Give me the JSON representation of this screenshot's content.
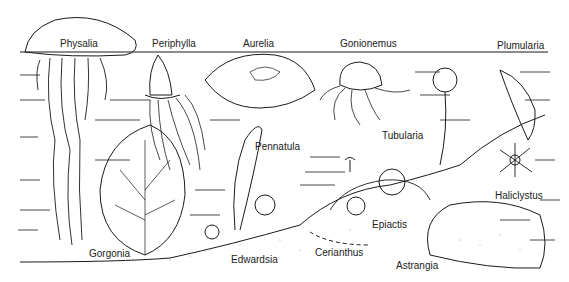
{
  "colors": {
    "ink": "#1a1a1a",
    "background": "#ffffff",
    "sand": "#bbbbbb"
  },
  "labels": [
    {
      "id": "physalia",
      "text": "Physalia",
      "x": 60,
      "y": 39
    },
    {
      "id": "periphylla",
      "text": "Periphylla",
      "x": 152,
      "y": 39
    },
    {
      "id": "aurelia",
      "text": "Aurelia",
      "x": 243,
      "y": 39
    },
    {
      "id": "gonionemus",
      "text": "Gonionemus",
      "x": 340,
      "y": 39
    },
    {
      "id": "plumularia",
      "text": "Plumularia",
      "x": 497,
      "y": 41
    },
    {
      "id": "tubularia",
      "text": "Tubularia",
      "x": 382,
      "y": 131
    },
    {
      "id": "pennatula",
      "text": "Pennatula",
      "x": 255,
      "y": 142
    },
    {
      "id": "haliclystus",
      "text": "Haliclystus",
      "x": 495,
      "y": 191
    },
    {
      "id": "epiactis",
      "text": "Epiactis",
      "x": 372,
      "y": 220
    },
    {
      "id": "gorgonia",
      "text": "Gorgonia",
      "x": 89,
      "y": 249
    },
    {
      "id": "edwardsia",
      "text": "Edwardsia",
      "x": 231,
      "y": 255
    },
    {
      "id": "cerianthus",
      "text": "Cerianthus",
      "x": 315,
      "y": 248
    },
    {
      "id": "astrangia",
      "text": "Astrangia",
      "x": 396,
      "y": 261
    }
  ]
}
